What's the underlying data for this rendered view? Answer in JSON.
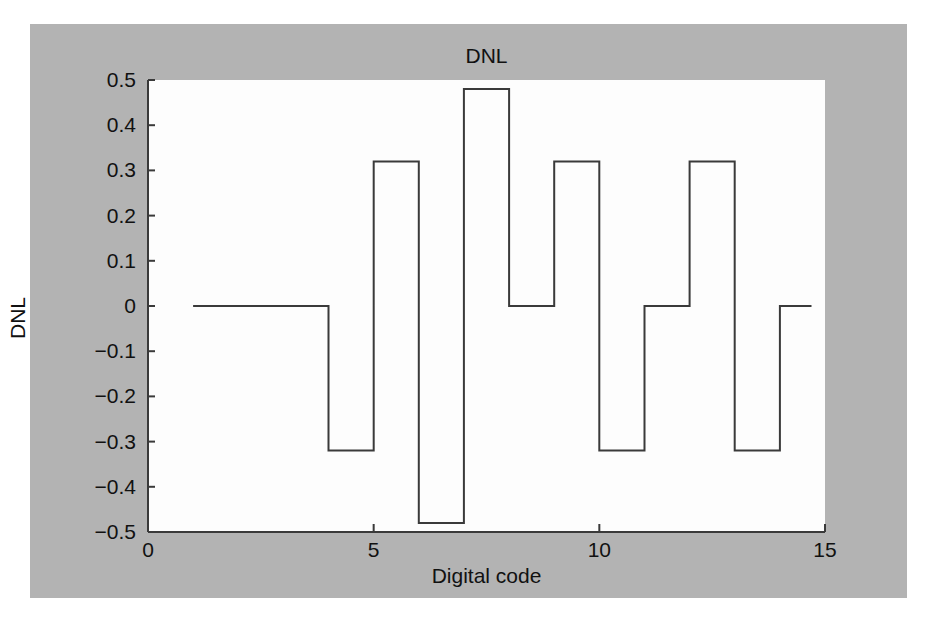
{
  "figure": {
    "background_color": "#b3b3b3",
    "plot_background_color": "#fdfdfd",
    "line_color": "#3a3a3a"
  },
  "chart_data": {
    "type": "line",
    "style": "step-post",
    "title": "DNL",
    "xlabel": "Digital code",
    "ylabel": "DNL",
    "xlim": [
      0,
      15
    ],
    "ylim": [
      -0.5,
      0.5
    ],
    "grid": false,
    "legend": null,
    "xticks": [
      0,
      5,
      10,
      15
    ],
    "xticklabels": [
      "0",
      "5",
      "10",
      "15"
    ],
    "yticks": [
      -0.5,
      -0.4,
      -0.3,
      -0.2,
      -0.1,
      0,
      0.1,
      0.2,
      0.3,
      0.4,
      0.5
    ],
    "yticklabels": [
      "−0.5",
      "−0.4",
      "−0.3",
      "−0.2",
      "−0.1",
      "0",
      "0.1",
      "0.2",
      "0.3",
      "0.4",
      "0.5"
    ],
    "x": [
      1,
      2,
      3,
      4,
      5,
      6,
      7,
      8,
      9,
      10,
      11,
      12,
      13,
      14,
      14.7
    ],
    "values": [
      0,
      0,
      0,
      -0.32,
      0.32,
      -0.48,
      0.48,
      0,
      0.32,
      -0.32,
      0,
      0.32,
      -0.32,
      0,
      0
    ]
  }
}
